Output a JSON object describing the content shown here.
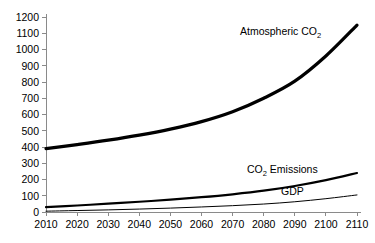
{
  "chart_data": {
    "type": "line",
    "title": "",
    "xlabel": "",
    "ylabel": "",
    "xlim": [
      2010,
      2110
    ],
    "ylim": [
      0,
      1200
    ],
    "grid": false,
    "legend_position": "inline-labels",
    "x": [
      2010,
      2020,
      2030,
      2040,
      2050,
      2060,
      2070,
      2080,
      2090,
      2100,
      2110
    ],
    "xtick_labels": [
      "2010",
      "2020",
      "2030",
      "2040",
      "2050",
      "2060",
      "2070",
      "2080",
      "2090",
      "2100",
      "2110"
    ],
    "ytick_labels": [
      "0",
      "100",
      "200",
      "300",
      "400",
      "500",
      "600",
      "700",
      "800",
      "900",
      "1000",
      "1100",
      "1200"
    ],
    "yticks": [
      0,
      100,
      200,
      300,
      400,
      500,
      600,
      700,
      800,
      900,
      1000,
      1100,
      1200
    ],
    "series": [
      {
        "name": "Atmospheric CO2",
        "label_main": "Atmospheric CO",
        "label_sub": "2",
        "stroke_width": 3.2,
        "color": "#000000",
        "values": [
          390,
          415,
          442,
          473,
          510,
          556,
          617,
          700,
          805,
          960,
          1150
        ]
      },
      {
        "name": "CO2 Emissions",
        "label_main": "CO",
        "label_sub": "2",
        "label_tail": " Emissions",
        "stroke_width": 2.2,
        "color": "#000000",
        "values": [
          30,
          40,
          51,
          63,
          76,
          91,
          109,
          131,
          160,
          196,
          240
        ]
      },
      {
        "name": "GDP",
        "label_main": "GDP",
        "label_sub": "",
        "stroke_width": 1.0,
        "color": "#000000",
        "values": [
          5,
          9,
          13,
          18,
          24,
          31,
          39,
          49,
          63,
          82,
          105
        ]
      }
    ],
    "annotations": [
      {
        "text": "Atmospheric CO2",
        "x_px": 240,
        "y_px": 35
      },
      {
        "text": "CO2 Emissions",
        "x_px": 247,
        "y_px": 173
      },
      {
        "text": "GDP",
        "x_px": 281,
        "y_px": 195
      }
    ],
    "axis_color": "#8a8a8a"
  }
}
